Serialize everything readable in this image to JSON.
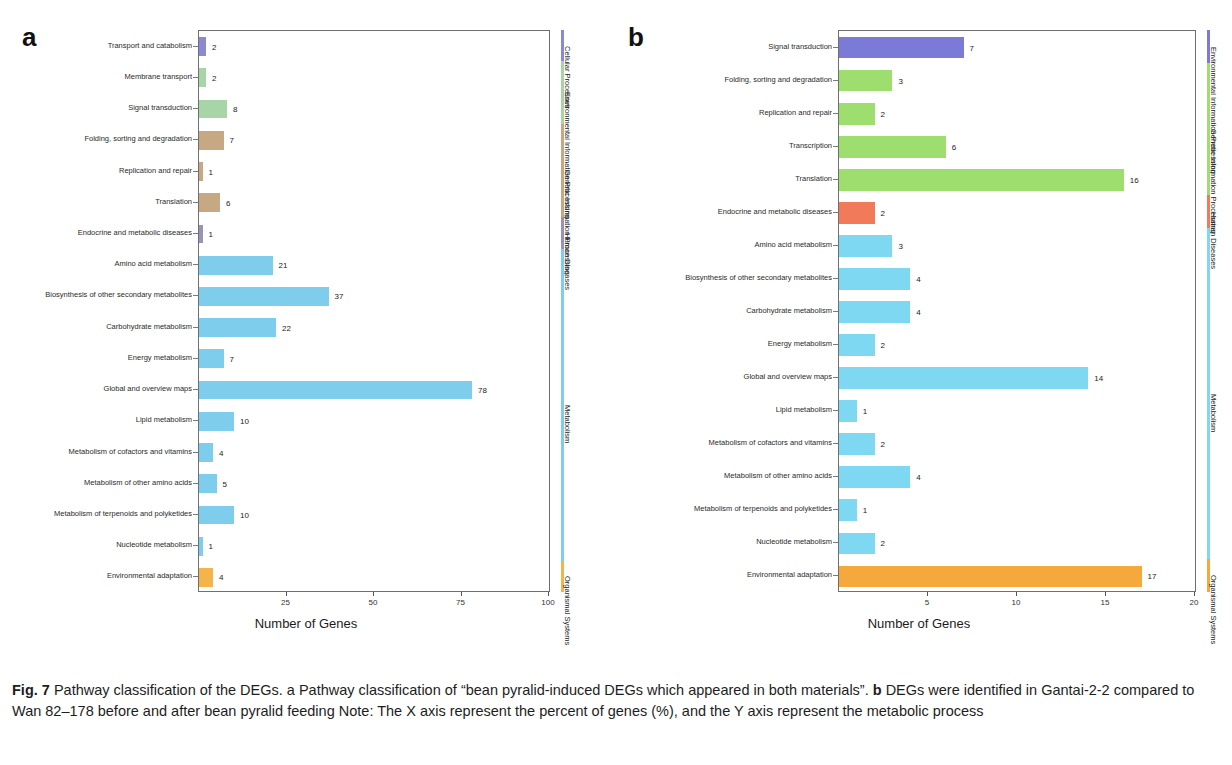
{
  "figure": {
    "caption_label": "Fig. 7",
    "caption_part1": " Pathway classification of the DEGs. a Pathway classification of “bean pyralid-induced DEGs which appeared in both materials”. ",
    "caption_b": "b",
    "caption_part2": " DEGs were identified in Gantai-2-2 compared to Wan 82–178 before and after bean pyralid feeding Note: The X axis represent the percent of genes (%), and the Y axis represent the metabolic process"
  },
  "panel_a": {
    "letter": "a",
    "chart_data": {
      "type": "bar",
      "title": "",
      "xlabel": "Number of Genes",
      "ylabel": "",
      "orientation": "horizontal",
      "xlim": [
        0,
        100
      ],
      "xticks": [
        0,
        25,
        50,
        75,
        100
      ],
      "xticklabels": [
        "0",
        "25",
        "50",
        "75",
        "100"
      ],
      "grid": false,
      "categories": [
        "Transport and catabolism",
        "Membrane transport",
        "Signal transduction",
        "Folding, sorting and degradation",
        "Replication and repair",
        "Translation",
        "Endocrine and metabolic diseases",
        "Amino acid metabolism",
        "Biosynthesis of other secondary metabolites",
        "Carbohydrate metabolism",
        "Energy metabolism",
        "Global and overview maps",
        "Lipid metabolism",
        "Metabolism of cofactors and vitamins",
        "Metabolism of other amino acids",
        "Metabolism of terpenoids and polyketides",
        "Nucleotide metabolism",
        "Environmental adaptation"
      ],
      "values": [
        2,
        2,
        8,
        7,
        1,
        6,
        1,
        21,
        37,
        22,
        7,
        78,
        10,
        4,
        5,
        10,
        1,
        4
      ],
      "bar_colors": [
        "#8a8ad4",
        "#a8d5a8",
        "#a8d5a8",
        "#c6a882",
        "#c6a882",
        "#c6a882",
        "#9a93b8",
        "#7ecdec",
        "#7ecdec",
        "#7ecdec",
        "#7ecdec",
        "#7ecdec",
        "#7ecdec",
        "#7ecdec",
        "#7ecdec",
        "#7ecdec",
        "#7ecdec",
        "#f5b44a"
      ]
    },
    "class_groups": [
      {
        "label": "Cellular Processes",
        "color": "#8a8ad4",
        "start": 0,
        "end": 1
      },
      {
        "label": "Environmental Information Processing",
        "color": "#a8d5a8",
        "start": 1,
        "end": 3
      },
      {
        "label": "Genetic Information Processing",
        "color": "#c6a882",
        "start": 3,
        "end": 6
      },
      {
        "label": "Human Diseases",
        "color": "#9a93b8",
        "start": 6,
        "end": 7
      },
      {
        "label": "Metabolism",
        "color": "#7ecdec",
        "start": 7,
        "end": 17
      },
      {
        "label": "Organismal Systems",
        "color": "#f5b44a",
        "start": 17,
        "end": 18
      }
    ]
  },
  "panel_b": {
    "letter": "b",
    "chart_data": {
      "type": "bar",
      "title": "",
      "xlabel": "Number of Genes",
      "ylabel": "",
      "orientation": "horizontal",
      "xlim": [
        0,
        20
      ],
      "xticks": [
        0,
        5,
        10,
        15,
        20
      ],
      "xticklabels": [
        "0",
        "5",
        "10",
        "15",
        "20"
      ],
      "grid": false,
      "categories": [
        "Signal transduction",
        "Folding, sorting and degradation",
        "Replication and repair",
        "Transcription",
        "Translation",
        "Endocrine and metabolic diseases",
        "Amino acid metabolism",
        "Biosynthesis of other secondary metabolites",
        "Carbohydrate metabolism",
        "Energy metabolism",
        "Global and overview maps",
        "Lipid metabolism",
        "Metabolism of cofactors and vitamins",
        "Metabolism of other amino acids",
        "Metabolism of terpenoids and polyketides",
        "Nucleotide metabolism",
        "Environmental adaptation"
      ],
      "values": [
        7,
        3,
        2,
        6,
        16,
        2,
        3,
        4,
        4,
        2,
        14,
        1,
        2,
        4,
        1,
        2,
        17
      ],
      "bar_colors": [
        "#7b7ad6",
        "#9ede6e",
        "#9ede6e",
        "#9ede6e",
        "#9ede6e",
        "#f07a5a",
        "#7ed8f2",
        "#7ed8f2",
        "#7ed8f2",
        "#7ed8f2",
        "#7ed8f2",
        "#7ed8f2",
        "#7ed8f2",
        "#7ed8f2",
        "#7ed8f2",
        "#7ed8f2",
        "#f5a93c"
      ]
    },
    "class_groups": [
      {
        "label": "Environmental Information Processing",
        "color": "#7b7ad6",
        "start": 0,
        "end": 1
      },
      {
        "label": "Genetic Information Processing",
        "color": "#9ede6e",
        "start": 1,
        "end": 5
      },
      {
        "label": "Human Diseases",
        "color": "#f07a5a",
        "start": 5,
        "end": 6
      },
      {
        "label": "Metabolism",
        "color": "#7ed8f2",
        "start": 6,
        "end": 16
      },
      {
        "label": "Organismal Systems",
        "color": "#f5a93c",
        "start": 16,
        "end": 17
      }
    ]
  }
}
